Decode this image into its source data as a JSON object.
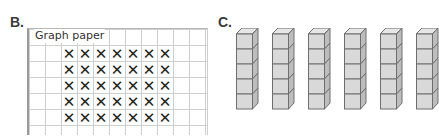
{
  "part_b": {
    "label": "B.",
    "grid_title": "Graph paper",
    "grid": {
      "columns": 11,
      "rows": 7
    },
    "x_array": {
      "rows": 5,
      "columns": 7,
      "mark": "✕"
    }
  },
  "part_c": {
    "label": "C.",
    "towers": {
      "count": 6,
      "cubes_per_tower": 5
    },
    "colors": {
      "face": "#d9d9d9",
      "side": "#bdbdbd",
      "top": "#e6e6e6",
      "edge": "#6e6e6e"
    }
  }
}
